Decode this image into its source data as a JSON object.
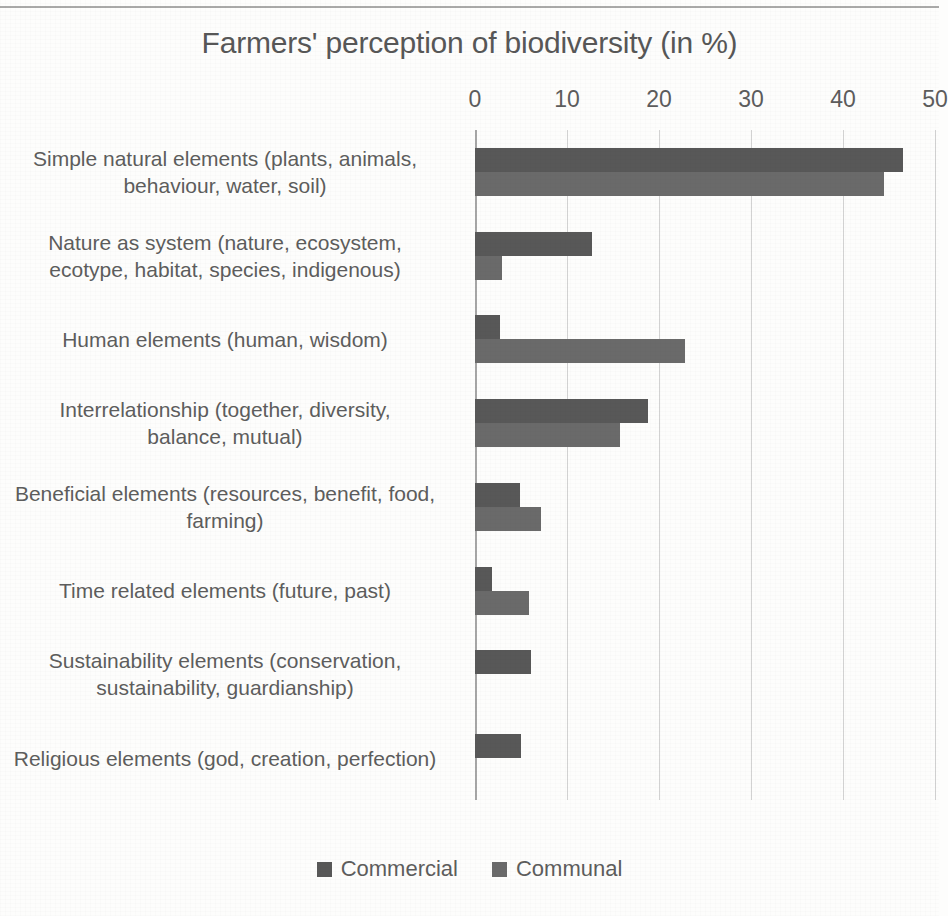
{
  "chart_data": {
    "type": "bar",
    "orientation": "horizontal",
    "title": "Farmers' perception of biodiversity (in %)",
    "xlabel": "",
    "ylabel": "",
    "xlim": [
      0,
      50
    ],
    "xticks": [
      0,
      10,
      20,
      30,
      40,
      50
    ],
    "grid": true,
    "legend_position": "bottom",
    "categories": [
      "Simple natural elements (plants, animals, behaviour, water, soil)",
      "Nature as system (nature, ecosystem, ecotype, habitat, species, indigenous)",
      "Human elements (human, wisdom)",
      "Interrelationship (together, diversity, balance, mutual)",
      "Beneficial elements (resources, benefit, food, farming)",
      "Time related elements (future, past)",
      "Sustainability elements (conservation, sustainability, guardianship)",
      "Religious elements (god, creation, perfection)"
    ],
    "category_lines": [
      [
        "Simple natural elements (plants, animals,",
        "behaviour, water, soil)"
      ],
      [
        "Nature as system (nature, ecosystem,",
        "ecotype, habitat, species, indigenous)"
      ],
      [
        "Human elements (human, wisdom)"
      ],
      [
        "Interrelationship (together, diversity,",
        "balance, mutual)"
      ],
      [
        "Beneficial elements (resources, benefit, food,",
        "farming)"
      ],
      [
        "Time related elements (future, past)"
      ],
      [
        "Sustainability elements (conservation,",
        "sustainability, guardianship)"
      ],
      [
        "Religious elements (god, creation, perfection)"
      ]
    ],
    "series": [
      {
        "name": "Commercial",
        "color": "#585858",
        "values": [
          46.5,
          12.7,
          2.7,
          18.8,
          4.9,
          1.8,
          6.1,
          5.0
        ]
      },
      {
        "name": "Communal",
        "color": "#6a6a6a",
        "values": [
          44.5,
          2.9,
          22.8,
          15.8,
          7.2,
          5.9,
          0,
          0
        ]
      }
    ]
  },
  "legend": {
    "items": [
      {
        "label": "Commercial",
        "color": "#585858"
      },
      {
        "label": "Communal",
        "color": "#6a6a6a"
      }
    ]
  }
}
